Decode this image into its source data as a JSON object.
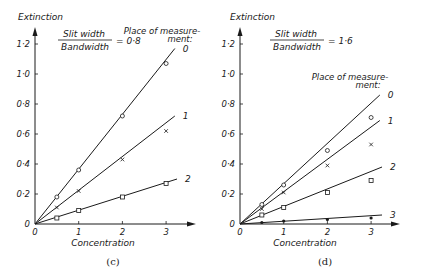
{
  "chart_data": [
    {
      "type": "line",
      "panel_label": "(c)",
      "title": "Slit width / Bandwidth = 0·8",
      "ratio_numerator": "Slit width",
      "ratio_denominator": "Bandwidth",
      "ratio_value": "= 0·8",
      "xlabel": "Concentration",
      "ylabel": "Extinction",
      "legend_title_line1": "Place of measure-",
      "legend_title_line2": "ment:",
      "xlim": [
        0,
        3.3
      ],
      "ylim": [
        0,
        1.25
      ],
      "x_ticks": [
        "0",
        "1",
        "2",
        "3"
      ],
      "y_ticks": [
        "0",
        "0·2",
        "0·4",
        "0·6",
        "0·8",
        "1·0",
        "1·2"
      ],
      "grid": false,
      "series": [
        {
          "name": "0",
          "marker": "circle",
          "x": [
            0.5,
            1,
            2,
            3
          ],
          "values": [
            0.18,
            0.36,
            0.72,
            1.07
          ],
          "fit_end": [
            3.2,
            1.17
          ]
        },
        {
          "name": "1",
          "marker": "cross",
          "x": [
            0.5,
            1,
            2,
            3
          ],
          "values": [
            0.11,
            0.22,
            0.43,
            0.62
          ],
          "fit_end": [
            3.2,
            0.72
          ]
        },
        {
          "name": "2",
          "marker": "square",
          "x": [
            0.5,
            1,
            2,
            3
          ],
          "values": [
            0.04,
            0.09,
            0.18,
            0.27
          ],
          "fit_end": [
            3.25,
            0.3
          ]
        }
      ]
    },
    {
      "type": "line",
      "panel_label": "(d)",
      "title": "Slit width / Bandwidth = 1·6",
      "ratio_numerator": "Slit width",
      "ratio_denominator": "Bandwidth",
      "ratio_value": "= 1·6",
      "xlabel": "Concentration",
      "ylabel": "Extinction",
      "legend_title_line1": "Place of measure-",
      "legend_title_line2": "ment:",
      "xlim": [
        0,
        3.3
      ],
      "ylim": [
        0,
        1.25
      ],
      "x_ticks": [
        "0",
        "1",
        "2",
        "3"
      ],
      "y_ticks": [
        "0",
        "0·2",
        "0·4",
        "0·6",
        "0·8",
        "1·0",
        "1·2"
      ],
      "grid": false,
      "series": [
        {
          "name": "0",
          "marker": "circle",
          "x": [
            0.5,
            1,
            2,
            3
          ],
          "values": [
            0.13,
            0.26,
            0.49,
            0.71
          ],
          "fit_end": [
            3.2,
            0.86
          ]
        },
        {
          "name": "1",
          "marker": "cross",
          "x": [
            0.5,
            1,
            2,
            3
          ],
          "values": [
            0.1,
            0.21,
            0.39,
            0.53
          ],
          "fit_end": [
            3.2,
            0.69
          ]
        },
        {
          "name": "2",
          "marker": "square",
          "x": [
            0.5,
            1,
            2,
            3
          ],
          "values": [
            0.06,
            0.11,
            0.21,
            0.29
          ],
          "fit_end": [
            3.25,
            0.38
          ]
        },
        {
          "name": "3",
          "marker": "dot",
          "x": [
            0.5,
            1,
            2,
            3
          ],
          "values": [
            0.01,
            0.02,
            0.03,
            0.04
          ],
          "fit_end": [
            3.25,
            0.06
          ]
        }
      ]
    }
  ],
  "layout": {
    "panels": [
      {
        "origin_x": 35,
        "origin_y": 224,
        "x_unit_px": 43.7,
        "y_unit_px": 150,
        "axis_x_end": 196,
        "axis_y_top": 27,
        "ylabel_pos": [
          18,
          20
        ],
        "ratio_pos": [
          58,
          37
        ],
        "legend_pos": [
          162,
          34
        ],
        "legend_anchor": "middle",
        "caption_pos": [
          113,
          265
        ],
        "xlabel_pos": [
          103,
          246
        ]
      },
      {
        "origin_x": 240,
        "origin_y": 224,
        "x_unit_px": 43.7,
        "y_unit_px": 150,
        "axis_x_end": 400,
        "axis_y_top": 27,
        "ylabel_pos": [
          230,
          20
        ],
        "ratio_pos": [
          270,
          37
        ],
        "legend_pos": [
          350,
          80
        ],
        "legend_anchor": "middle",
        "caption_pos": [
          325,
          265
        ],
        "xlabel_pos": [
          305,
          246
        ]
      }
    ],
    "ink": "#1a1a1a"
  }
}
